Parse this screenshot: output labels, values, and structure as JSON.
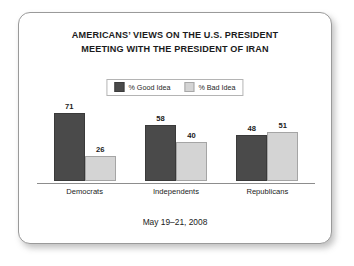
{
  "card": {
    "title_lines": [
      "AMERICANS’ VIEWS ON THE U.S. PRESIDENT",
      "MEETING WITH THE PRESIDENT OF IRAN"
    ],
    "footer": "May 19–21, 2008"
  },
  "legend": {
    "items": [
      {
        "label": "% Good Idea",
        "icon": "legend-swatch-dark",
        "color": "#4a4a4a"
      },
      {
        "label": "% Bad Idea",
        "icon": "legend-swatch-light",
        "color": "#d4d4d4"
      }
    ]
  },
  "chart_data": {
    "type": "bar",
    "title": "AMERICANS’ VIEWS ON THE U.S. PRESIDENT MEETING WITH THE PRESIDENT OF IRAN",
    "subtitle": "May 19–21, 2008",
    "categories": [
      "Democrats",
      "Independents",
      "Republicans"
    ],
    "series": [
      {
        "name": "% Good Idea",
        "color": "#4a4a4a",
        "values": [
          71,
          58,
          48
        ]
      },
      {
        "name": "% Bad Idea",
        "color": "#d4d4d4",
        "values": [
          26,
          40,
          51
        ]
      }
    ],
    "xlabel": "",
    "ylabel": "",
    "ylim": [
      0,
      100
    ],
    "grid": false,
    "legend_position": "top-center",
    "value_labels": true,
    "axis_line": "baseline-only"
  }
}
